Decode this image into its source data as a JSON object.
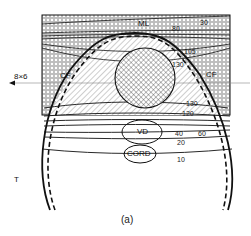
{
  "figure": {
    "caption": "(a)",
    "field_label": "8×6",
    "side_label": "T",
    "structures": {
      "midline": "ML",
      "cord": "CORD",
      "vd": "VD",
      "cf_left": "CF",
      "cf_right": "CF"
    },
    "isodose_labels": {
      "top_30": "30",
      "top_80": "80",
      "upper_105": "105",
      "upper_130": "130",
      "lower_130": "130",
      "lower_120": "120",
      "mid_40": "40",
      "mid_60": "60",
      "mid_20": "20",
      "low_10": "10"
    },
    "colors": {
      "line": "#111111",
      "background": "#ffffff",
      "beam_axis": "#888888"
    }
  }
}
